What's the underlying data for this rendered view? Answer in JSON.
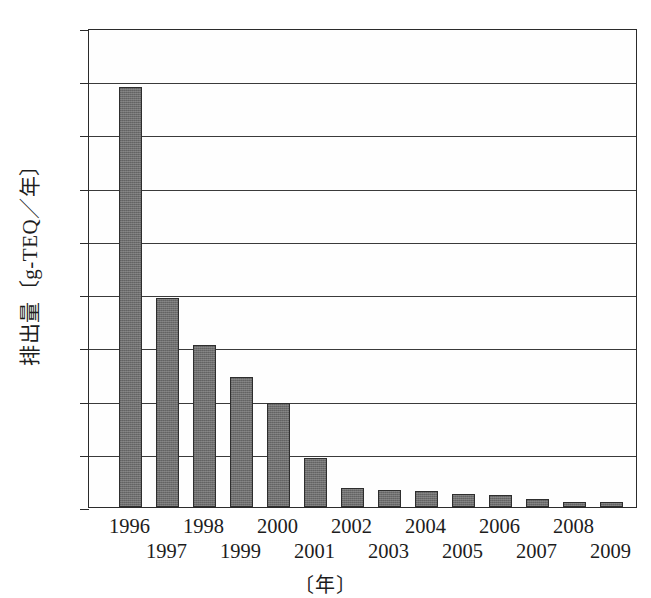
{
  "chart_data": {
    "type": "bar",
    "title": "",
    "subtitle": "",
    "xlabel": "〔年〕",
    "ylabel": "排出量〔g-TEQ／年〕",
    "categories": [
      "1996",
      "1997",
      "1998",
      "1999",
      "2000",
      "2001",
      "2002",
      "2003",
      "2004",
      "2005",
      "2006",
      "2007",
      "2008",
      "2009"
    ],
    "values": [
      7900,
      3930,
      3040,
      2440,
      1950,
      930,
      350,
      320,
      310,
      240,
      230,
      150,
      90,
      100
    ],
    "series": [
      {
        "name": "排出量",
        "values": [
          7900,
          3930,
          3040,
          2440,
          1950,
          930,
          350,
          320,
          310,
          240,
          230,
          150,
          90,
          100
        ]
      }
    ],
    "ylim": [
      0,
      9000
    ],
    "ytick_values": [
      0,
      1000,
      2000,
      3000,
      4000,
      5000,
      6000,
      7000,
      8000,
      9000
    ],
    "ytick_labels": [
      "0",
      "1000",
      "2000",
      "3000",
      "4000",
      "5000",
      "6000",
      "7000",
      "8000",
      "9000"
    ],
    "xtick_labels_top_row": [
      "1996",
      "1998",
      "2000",
      "2002",
      "2004",
      "2006",
      "2008"
    ],
    "xtick_labels_bottom_row": [
      "1997",
      "1999",
      "2001",
      "2003",
      "2005",
      "2007",
      "2009"
    ],
    "grid": "horizontal",
    "legend": "none",
    "bar_color": "#6e6e6e",
    "bar_border_color": "#2e2e2e",
    "axis_color": "#2b2b2b",
    "background_color": "#ffffff",
    "annotations": []
  }
}
